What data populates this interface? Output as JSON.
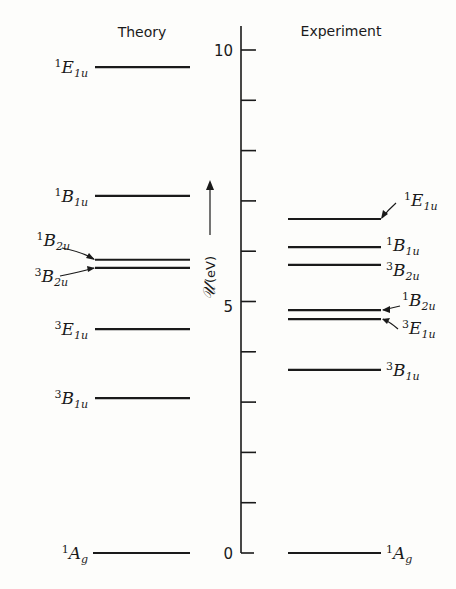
{
  "titles": {
    "theory": "Theory",
    "experiment": "Experiment"
  },
  "axis": {
    "label_symbol": "𝒰",
    "label_unit": "(eV)",
    "ticks": [
      0,
      1,
      2,
      3,
      4,
      5,
      6,
      7,
      8,
      9,
      10
    ],
    "labeled_ticks": {
      "0": "0",
      "5": "5",
      "10": "10"
    }
  },
  "chart_data": {
    "type": "energy-level-diagram",
    "title": "",
    "ylabel": "𝒰 (eV)",
    "ylim": [
      0,
      10
    ],
    "yticks_labeled": [
      0,
      5,
      10
    ],
    "yticks_minor_step": 1,
    "series": [
      {
        "name": "Theory",
        "levels": [
          {
            "state": "1E1u",
            "sup": "1",
            "sym": "E",
            "sub": "1u",
            "energy_eV": 9.66
          },
          {
            "state": "1B1u",
            "sup": "1",
            "sym": "B",
            "sub": "1u",
            "energy_eV": 7.1
          },
          {
            "state": "1B2u",
            "sup": "1",
            "sym": "B",
            "sub": "2u",
            "energy_eV": 5.83
          },
          {
            "state": "3B2u",
            "sup": "3",
            "sym": "B",
            "sub": "2u",
            "energy_eV": 5.67
          },
          {
            "state": "3E1u",
            "sup": "3",
            "sym": "E",
            "sub": "1u",
            "energy_eV": 4.45
          },
          {
            "state": "3B1u",
            "sup": "3",
            "sym": "B",
            "sub": "1u",
            "energy_eV": 3.08
          },
          {
            "state": "1Ag",
            "sup": "1",
            "sym": "A",
            "sub": "g",
            "energy_eV": 0.0
          }
        ]
      },
      {
        "name": "Experiment",
        "levels": [
          {
            "state": "1E1u",
            "sup": "1",
            "sym": "E",
            "sub": "1u",
            "energy_eV": 6.64
          },
          {
            "state": "1B1u",
            "sup": "1",
            "sym": "B",
            "sub": "1u",
            "energy_eV": 6.08
          },
          {
            "state": "3B2u",
            "sup": "3",
            "sym": "B",
            "sub": "2u",
            "energy_eV": 5.73
          },
          {
            "state": "1B2u",
            "sup": "1",
            "sym": "B",
            "sub": "2u",
            "energy_eV": 4.83
          },
          {
            "state": "3E1u",
            "sup": "3",
            "sym": "E",
            "sub": "1u",
            "energy_eV": 4.65
          },
          {
            "state": "3B1u",
            "sup": "3",
            "sym": "B",
            "sub": "1u",
            "energy_eV": 3.64
          },
          {
            "state": "1Ag",
            "sup": "1",
            "sym": "A",
            "sub": "g",
            "energy_eV": 0.0
          }
        ]
      }
    ]
  }
}
